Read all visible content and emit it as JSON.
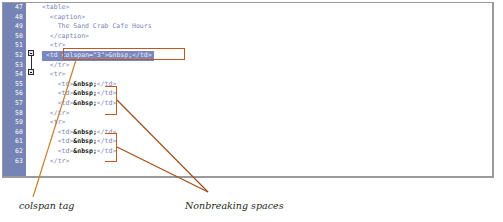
{
  "editor": {
    "first_line_number": 47,
    "gutter_color": "#7683b5",
    "selection_color": "#7b86bf",
    "lines": [
      {
        "num": "47",
        "text": "<table>"
      },
      {
        "num": "48",
        "text": "  <caption>"
      },
      {
        "num": "49",
        "text": "    The Sand Crab Cafe Hours"
      },
      {
        "num": "50",
        "text": "  </caption>"
      },
      {
        "num": "51",
        "text": "  <tr>"
      },
      {
        "num": "52",
        "text": "    <td colspan=\"3\">&nbsp;</td>",
        "selected": true
      },
      {
        "num": "53",
        "text": "  </tr>"
      },
      {
        "num": "54",
        "text": "  <tr>"
      },
      {
        "num": "55",
        "text": "    <td>&nbsp;</td>"
      },
      {
        "num": "56",
        "text": "    <td>&nbsp;</td>"
      },
      {
        "num": "57",
        "text": "    <td>&nbsp;</td>"
      },
      {
        "num": "58",
        "text": "  </tr>"
      },
      {
        "num": "59",
        "text": "  <tr>"
      },
      {
        "num": "60",
        "text": "    <td>&nbsp;</td>"
      },
      {
        "num": "61",
        "text": "    <td>&nbsp;</td>"
      },
      {
        "num": "62",
        "text": "    <td>&nbsp;</td>"
      },
      {
        "num": "63",
        "text": "  </tr>"
      }
    ],
    "fold_markers": [
      {
        "line": "51",
        "type": "expanded"
      },
      {
        "line": "53",
        "type": "expanded"
      }
    ]
  },
  "annotations": {
    "color": "#c05a1e",
    "items": [
      {
        "id": "colspan",
        "label": "colspan tag"
      },
      {
        "id": "nbsp",
        "label": "Nonbreaking spaces"
      }
    ]
  }
}
